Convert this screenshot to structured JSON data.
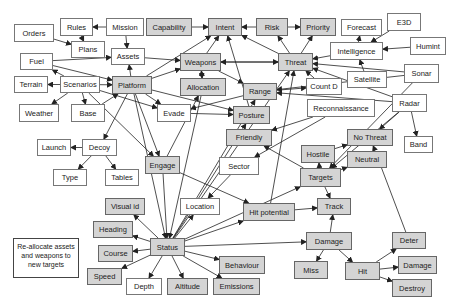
{
  "colors": {
    "gray_node": "#d4d4d4",
    "white_node": "#ffffff",
    "edge": "#222222"
  },
  "note": {
    "text": "Re-allocate assets and weapons to new targets",
    "x": 13,
    "y": 238,
    "w": 66,
    "h": 40
  },
  "nodes": [
    {
      "id": "orders",
      "label": "Orders",
      "x": 14,
      "y": 24,
      "w": 40,
      "h": 18,
      "style": "w"
    },
    {
      "id": "rules",
      "label": "Rules",
      "x": 60,
      "y": 18,
      "w": 33,
      "h": 18,
      "style": "w"
    },
    {
      "id": "mission",
      "label": "Mission",
      "x": 106,
      "y": 18,
      "w": 38,
      "h": 18,
      "style": "w"
    },
    {
      "id": "plans",
      "label": "Plans",
      "x": 71,
      "y": 41,
      "w": 34,
      "h": 17,
      "style": "w"
    },
    {
      "id": "assets",
      "label": "Assets",
      "x": 111,
      "y": 48,
      "w": 34,
      "h": 17,
      "style": "w"
    },
    {
      "id": "fuel",
      "label": "Fuel",
      "x": 20,
      "y": 53,
      "w": 33,
      "h": 17,
      "style": "w"
    },
    {
      "id": "terrain",
      "label": "Terrain",
      "x": 14,
      "y": 76,
      "w": 34,
      "h": 17,
      "style": "w"
    },
    {
      "id": "scenarios",
      "label": "Scenarios",
      "x": 60,
      "y": 76,
      "w": 40,
      "h": 17,
      "style": "w"
    },
    {
      "id": "platform",
      "label": "Platform",
      "x": 112,
      "y": 76,
      "w": 40,
      "h": 18,
      "style": "g"
    },
    {
      "id": "weather",
      "label": "Weather",
      "x": 19,
      "y": 104,
      "w": 40,
      "h": 18,
      "style": "w"
    },
    {
      "id": "base",
      "label": "Base",
      "x": 71,
      "y": 104,
      "w": 34,
      "h": 18,
      "style": "w"
    },
    {
      "id": "evade",
      "label": "Evade",
      "x": 157,
      "y": 104,
      "w": 34,
      "h": 18,
      "style": "w"
    },
    {
      "id": "launch",
      "label": "Launch",
      "x": 37,
      "y": 139,
      "w": 34,
      "h": 17,
      "style": "w"
    },
    {
      "id": "decoy",
      "label": "Decoy",
      "x": 82,
      "y": 139,
      "w": 35,
      "h": 17,
      "style": "w"
    },
    {
      "id": "type",
      "label": "Type",
      "x": 53,
      "y": 169,
      "w": 34,
      "h": 17,
      "style": "w"
    },
    {
      "id": "tables",
      "label": "Tables",
      "x": 105,
      "y": 169,
      "w": 34,
      "h": 17,
      "style": "w"
    },
    {
      "id": "capability",
      "label": "Capability",
      "x": 146,
      "y": 18,
      "w": 46,
      "h": 18,
      "style": "g"
    },
    {
      "id": "intent",
      "label": "Intent",
      "x": 208,
      "y": 18,
      "w": 34,
      "h": 18,
      "style": "g"
    },
    {
      "id": "risk",
      "label": "Risk",
      "x": 256,
      "y": 18,
      "w": 32,
      "h": 18,
      "style": "g"
    },
    {
      "id": "priority",
      "label": "Priority",
      "x": 300,
      "y": 18,
      "w": 36,
      "h": 18,
      "style": "g"
    },
    {
      "id": "forecast",
      "label": "Forecast",
      "x": 341,
      "y": 19,
      "w": 41,
      "h": 17,
      "style": "w"
    },
    {
      "id": "e3d",
      "label": "E3D",
      "x": 387,
      "y": 13,
      "w": 34,
      "h": 18,
      "style": "w"
    },
    {
      "id": "humint",
      "label": "Humint",
      "x": 410,
      "y": 37,
      "w": 36,
      "h": 18,
      "style": "w"
    },
    {
      "id": "intelligence",
      "label": "Intelligence",
      "x": 330,
      "y": 42,
      "w": 53,
      "h": 18,
      "style": "w"
    },
    {
      "id": "weapons",
      "label": "Weapons",
      "x": 180,
      "y": 53,
      "w": 41,
      "h": 18,
      "style": "g"
    },
    {
      "id": "threat",
      "label": "Threat",
      "x": 278,
      "y": 53,
      "w": 35,
      "h": 18,
      "style": "g"
    },
    {
      "id": "satellite",
      "label": "Satellite",
      "x": 347,
      "y": 71,
      "w": 40,
      "h": 17,
      "style": "w"
    },
    {
      "id": "sonar",
      "label": "Sonar",
      "x": 404,
      "y": 64,
      "w": 35,
      "h": 19,
      "style": "w"
    },
    {
      "id": "allocation",
      "label": "Allocation",
      "x": 180,
      "y": 78,
      "w": 46,
      "h": 18,
      "style": "g"
    },
    {
      "id": "countd",
      "label": "Count D",
      "x": 306,
      "y": 78,
      "w": 36,
      "h": 17,
      "style": "w"
    },
    {
      "id": "range",
      "label": "Range",
      "x": 243,
      "y": 83,
      "w": 34,
      "h": 17,
      "style": "g"
    },
    {
      "id": "recon",
      "label": "Reconnaissance",
      "x": 307,
      "y": 99,
      "w": 68,
      "h": 18,
      "style": "w"
    },
    {
      "id": "radar",
      "label": "Radar",
      "x": 392,
      "y": 94,
      "w": 35,
      "h": 18,
      "style": "w"
    },
    {
      "id": "posture",
      "label": "Posture",
      "x": 233,
      "y": 106,
      "w": 37,
      "h": 18,
      "style": "g"
    },
    {
      "id": "friendly",
      "label": "Friendly",
      "x": 226,
      "y": 129,
      "w": 46,
      "h": 17,
      "style": "g"
    },
    {
      "id": "nothreat",
      "label": "No Threat",
      "x": 347,
      "y": 129,
      "w": 46,
      "h": 17,
      "style": "g"
    },
    {
      "id": "band",
      "label": "Band",
      "x": 404,
      "y": 136,
      "w": 29,
      "h": 17,
      "style": "w"
    },
    {
      "id": "engage",
      "label": "Engage",
      "x": 145,
      "y": 156,
      "w": 35,
      "h": 18,
      "style": "g"
    },
    {
      "id": "sector",
      "label": "Sector",
      "x": 219,
      "y": 157,
      "w": 40,
      "h": 18,
      "style": "w"
    },
    {
      "id": "hostile",
      "label": "Hostile",
      "x": 301,
      "y": 145,
      "w": 34,
      "h": 18,
      "style": "g"
    },
    {
      "id": "neutral",
      "label": "Neutral",
      "x": 347,
      "y": 151,
      "w": 40,
      "h": 17,
      "style": "g"
    },
    {
      "id": "targets",
      "label": "Targets",
      "x": 300,
      "y": 168,
      "w": 41,
      "h": 19,
      "style": "g"
    },
    {
      "id": "visualid",
      "label": "Visual id",
      "x": 105,
      "y": 198,
      "w": 40,
      "h": 17,
      "style": "g"
    },
    {
      "id": "location",
      "label": "Location",
      "x": 180,
      "y": 198,
      "w": 40,
      "h": 17,
      "style": "w"
    },
    {
      "id": "hitpotential",
      "label": "Hit potential",
      "x": 243,
      "y": 203,
      "w": 52,
      "h": 18,
      "style": "g"
    },
    {
      "id": "track",
      "label": "Track",
      "x": 317,
      "y": 198,
      "w": 34,
      "h": 17,
      "style": "g"
    },
    {
      "id": "heading",
      "label": "Heading",
      "x": 93,
      "y": 221,
      "w": 40,
      "h": 17,
      "style": "g"
    },
    {
      "id": "status",
      "label": "Status",
      "x": 150,
      "y": 238,
      "w": 35,
      "h": 18,
      "style": "g"
    },
    {
      "id": "damage",
      "label": "Damage",
      "x": 306,
      "y": 232,
      "w": 46,
      "h": 18,
      "style": "g"
    },
    {
      "id": "course",
      "label": "Course",
      "x": 98,
      "y": 245,
      "w": 35,
      "h": 17,
      "style": "g"
    },
    {
      "id": "behaviour",
      "label": "Behaviour",
      "x": 219,
      "y": 256,
      "w": 46,
      "h": 18,
      "style": "g"
    },
    {
      "id": "deter",
      "label": "Deter",
      "x": 392,
      "y": 232,
      "w": 34,
      "h": 17,
      "style": "g"
    },
    {
      "id": "speed",
      "label": "Speed",
      "x": 87,
      "y": 268,
      "w": 35,
      "h": 17,
      "style": "g"
    },
    {
      "id": "depth",
      "label": "Depth",
      "x": 126,
      "y": 278,
      "w": 36,
      "h": 17,
      "style": "w"
    },
    {
      "id": "altitude",
      "label": "Altitude",
      "x": 167,
      "y": 278,
      "w": 41,
      "h": 17,
      "style": "g"
    },
    {
      "id": "emissions",
      "label": "Emissions",
      "x": 213,
      "y": 278,
      "w": 47,
      "h": 17,
      "style": "g"
    },
    {
      "id": "miss",
      "label": "Miss",
      "x": 294,
      "y": 261,
      "w": 34,
      "h": 18,
      "style": "g"
    },
    {
      "id": "hit",
      "label": "Hit",
      "x": 345,
      "y": 262,
      "w": 35,
      "h": 18,
      "style": "g"
    },
    {
      "id": "damage2",
      "label": "Damage",
      "x": 398,
      "y": 256,
      "w": 39,
      "h": 18,
      "style": "g"
    },
    {
      "id": "destroy",
      "label": "Destroy",
      "x": 392,
      "y": 279,
      "w": 40,
      "h": 18,
      "style": "g"
    }
  ],
  "edges": [
    [
      "mission",
      "rules"
    ],
    [
      "orders",
      "plans"
    ],
    [
      "rules",
      "plans"
    ],
    [
      "mission",
      "assets"
    ],
    [
      "fuel",
      "assets"
    ],
    [
      "fuel",
      "platform"
    ],
    [
      "scenarios",
      "fuel"
    ],
    [
      "scenarios",
      "terrain"
    ],
    [
      "scenarios",
      "weather"
    ],
    [
      "scenarios",
      "base"
    ],
    [
      "scenarios",
      "platform"
    ],
    [
      "scenarios",
      "evade"
    ],
    [
      "scenarios",
      "engage"
    ],
    [
      "platform",
      "assets"
    ],
    [
      "platform",
      "weapons"
    ],
    [
      "platform",
      "intent"
    ],
    [
      "platform",
      "evade"
    ],
    [
      "platform",
      "posture"
    ],
    [
      "platform",
      "decoy"
    ],
    [
      "platform",
      "engage"
    ],
    [
      "base",
      "platform"
    ],
    [
      "assets",
      "weapons"
    ],
    [
      "decoy",
      "launch"
    ],
    [
      "decoy",
      "type"
    ],
    [
      "decoy",
      "tables"
    ],
    [
      "capability",
      "intent"
    ],
    [
      "risk",
      "intent"
    ],
    [
      "risk",
      "priority"
    ],
    [
      "weapons",
      "intent"
    ],
    [
      "weapons",
      "allocation"
    ],
    [
      "weapons",
      "range"
    ],
    [
      "weapons",
      "threat"
    ],
    [
      "allocation",
      "weapons"
    ],
    [
      "threat",
      "intent"
    ],
    [
      "threat",
      "risk"
    ],
    [
      "threat",
      "priority"
    ],
    [
      "threat",
      "weapons"
    ],
    [
      "intelligence",
      "threat"
    ],
    [
      "intelligence",
      "forecast"
    ],
    [
      "e3d",
      "intelligence"
    ],
    [
      "humint",
      "intelligence"
    ],
    [
      "satellite",
      "intelligence"
    ],
    [
      "sonar",
      "threat"
    ],
    [
      "sonar",
      "range"
    ],
    [
      "sonar",
      "targets"
    ],
    [
      "countd",
      "threat"
    ],
    [
      "range",
      "countd"
    ],
    [
      "radar",
      "range"
    ],
    [
      "radar",
      "threat"
    ],
    [
      "radar",
      "band"
    ],
    [
      "radar",
      "targets"
    ],
    [
      "radar",
      "nothreat"
    ],
    [
      "recon",
      "friendly"
    ],
    [
      "recon",
      "sector"
    ],
    [
      "evade",
      "posture"
    ],
    [
      "range",
      "evade"
    ],
    [
      "posture",
      "intent"
    ],
    [
      "status",
      "posture"
    ],
    [
      "status",
      "range"
    ],
    [
      "hostile",
      "nothreat"
    ],
    [
      "targets",
      "hostile"
    ],
    [
      "targets",
      "neutral"
    ],
    [
      "targets",
      "track"
    ],
    [
      "targets",
      "friendly"
    ],
    [
      "hitpotential",
      "track"
    ],
    [
      "damage",
      "track"
    ],
    [
      "damage",
      "miss"
    ],
    [
      "damage",
      "hit"
    ],
    [
      "hit",
      "deter"
    ],
    [
      "hit",
      "damage2"
    ],
    [
      "hit",
      "destroy"
    ],
    [
      "deter",
      "nothreat"
    ],
    [
      "status",
      "visualid"
    ],
    [
      "status",
      "location"
    ],
    [
      "status",
      "heading"
    ],
    [
      "status",
      "course"
    ],
    [
      "status",
      "speed"
    ],
    [
      "status",
      "depth"
    ],
    [
      "status",
      "altitude"
    ],
    [
      "status",
      "emissions"
    ],
    [
      "status",
      "behaviour"
    ],
    [
      "status",
      "threat"
    ],
    [
      "status",
      "damage"
    ],
    [
      "status",
      "targets"
    ],
    [
      "platform",
      "status"
    ],
    [
      "engage",
      "status"
    ],
    [
      "engage",
      "allocation"
    ],
    [
      "engage",
      "hitpotential"
    ],
    [
      "sector",
      "location"
    ],
    [
      "hitpotential",
      "threat"
    ],
    [
      "allocation",
      "status"
    ],
    [
      "status",
      "hitpotential"
    ]
  ]
}
